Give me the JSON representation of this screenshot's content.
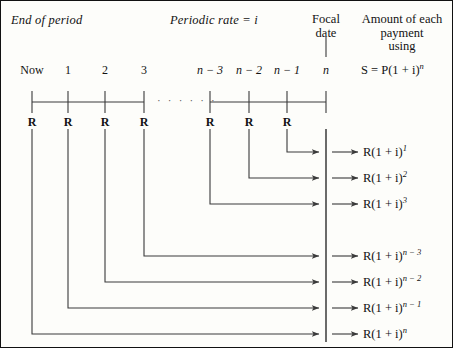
{
  "figure": {
    "title_left": "End of period",
    "title_center": "Periodic rate  =  i",
    "focal_header_line1": "Focal",
    "focal_header_line2": "date",
    "amount_header_line1": "Amount of each",
    "amount_header_line2": "payment",
    "amount_header_line3": "using",
    "formula_S": "S  =  P(1 + i)",
    "formula_S_exp": "n",
    "background_color": "#fdfdfa",
    "line_color": "#3a3a3a",
    "border_color": "#111111"
  },
  "timeline": {
    "period_labels": [
      "Now",
      "1",
      "2",
      "3",
      "n − 3",
      "n − 2",
      "n − 1",
      "n"
    ],
    "payment_labels": [
      "R",
      "R",
      "R",
      "R",
      "R",
      "R",
      "R"
    ],
    "ellipsis": "· · · · · ·",
    "focal_point_label": "n"
  },
  "payments": [
    {
      "base": "R(1 + i)",
      "exponent": "1",
      "period": "n − 1"
    },
    {
      "base": "R(1 + i)",
      "exponent": "2",
      "period": "n − 2"
    },
    {
      "base": "R(1 + i)",
      "exponent": "3",
      "period": "n − 3"
    },
    {
      "base": "R(1 + i)",
      "exponent": "n − 3",
      "period": "3"
    },
    {
      "base": "R(1 + i)",
      "exponent": "n − 2",
      "period": "2"
    },
    {
      "base": "R(1 + i)",
      "exponent": "n − 1",
      "period": "1"
    },
    {
      "base": "R(1 + i)",
      "exponent": "n",
      "period": "Now"
    }
  ]
}
